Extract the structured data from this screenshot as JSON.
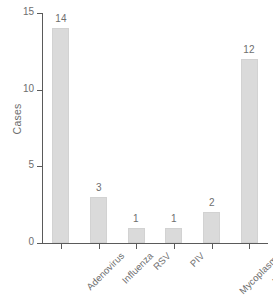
{
  "chart_data": {
    "type": "bar",
    "title": "",
    "xlabel": "",
    "ylabel": "Cases",
    "categories": [
      "Adenovirus",
      "Influenza",
      "RSV",
      "PIV",
      "Mycoplasma",
      "Unknown"
    ],
    "values": [
      14,
      3,
      1,
      1,
      2,
      12
    ],
    "value_labels": [
      "14",
      "3",
      "1",
      "1",
      "2",
      "12"
    ],
    "ylim": [
      0,
      15
    ],
    "yticks": [
      0,
      5,
      10,
      15
    ],
    "ytick_labels": [
      "0",
      "5",
      "10",
      "15"
    ],
    "grid": false,
    "legend": false,
    "bar_color": "#dadada",
    "bar_edge_color": "#d2d2d2",
    "axis_color": "#5a5a5a",
    "text_color": "#6e6e6e",
    "background_color": "#ffffff",
    "category_label_rotation_deg": 45
  }
}
